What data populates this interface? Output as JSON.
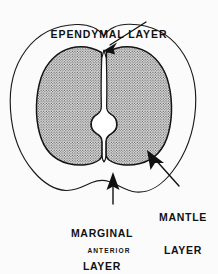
{
  "figure": {
    "orientation_note": "ANTERIOR",
    "background_color": "#fbfbfb",
    "outline_color": "#1a1a1a",
    "stipple_color": "#555555",
    "stipple_fill": "#e9e9e9",
    "canal_fill": "#ffffff"
  },
  "labels": {
    "ependymal": {
      "line1": "EPENDYMAL LAYER",
      "name": "ependymal-layer-label"
    },
    "marginal": {
      "line1": "MARGINAL",
      "line2": "LAYER",
      "name": "marginal-layer-label"
    },
    "mantle": {
      "line1": "MANTLE",
      "line2": "LAYER",
      "name": "mantle-layer-label"
    },
    "anterior": {
      "line1": "ANTERIOR",
      "name": "anterior-orientation-label"
    }
  },
  "leaders": {
    "ependymal_arrow": "points down-left to central canal at top midline",
    "mantle_arrow": "points up-left into right stippled mantle lobe",
    "marginal_arrow": "points straight up into white marginal zone at bottom"
  }
}
